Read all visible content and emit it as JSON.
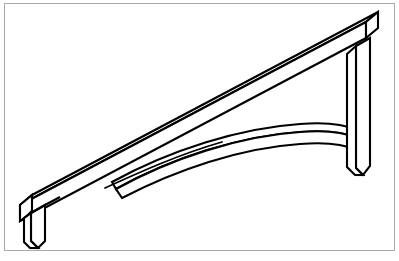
{
  "figure": {
    "domain_label": "technical-line-drawing",
    "caption": "",
    "width": 399,
    "height": 261,
    "background_color": "#ffffff",
    "line_color": "#000000",
    "frame_color": "#a9a9a9",
    "frame": {
      "x": 4,
      "y": 3,
      "width": 390,
      "height": 247,
      "stroke_width": 1
    }
  },
  "parts": [
    {
      "id": "diagonal-beam",
      "name": "Diagonal top beam",
      "description": "Long rectangular bar rising from lower left to upper right in oblique projection, shown with top face and front face.",
      "depth_offset_x": 12,
      "depth_offset_y": -10
    },
    {
      "id": "vertical-post",
      "name": "Right vertical post",
      "description": "Vertical rectangular column at the right end descending from the beam's high end.",
      "top_y": 30,
      "bottom_y": 175
    },
    {
      "id": "curved-brace",
      "name": "Curved arched brace",
      "description": "Arched rib spanning from mid-span of the diagonal beam to the bottom of the vertical post.",
      "left_anchor_x": 105,
      "left_anchor_y": 188,
      "right_anchor_x": 358,
      "right_anchor_y": 148
    },
    {
      "id": "left-foot",
      "name": "Left mounting foot",
      "description": "Short downward tab at the lower-left end of the diagonal beam.",
      "x": 30,
      "y": 215,
      "height": 33
    },
    {
      "id": "left-end-cap",
      "name": "Left beam end cap",
      "description": "Chamfered end face of the diagonal beam at its lower-left extremity."
    }
  ],
  "geometry": {
    "projection": "oblique / isometric-style 2D line art",
    "stroke_width_main": 2.1,
    "stroke_width_detail": 1.8,
    "beam_low_left": {
      "x": 20,
      "y": 205
    },
    "beam_high_right": {
      "x": 366,
      "y": 20
    }
  }
}
